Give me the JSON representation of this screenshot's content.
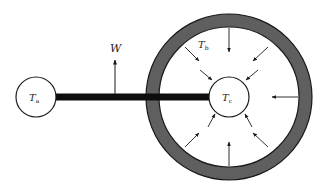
{
  "diagram": {
    "type": "heat-transfer-schematic",
    "colors": {
      "background": "#ffffff",
      "stroke": "#1a1a1a",
      "ring_fill": "#5f5f5f",
      "rod": "#0d0d0d"
    },
    "left_node": {
      "label_main": "T",
      "label_sub": "a",
      "cx": 36,
      "cy": 97,
      "r": 20
    },
    "rod": {
      "x1": 56,
      "x2": 209,
      "y": 97,
      "thickness": 7
    },
    "load": {
      "label": "W",
      "x": 115,
      "y_base": 94,
      "y_tip": 60,
      "label_x": 110,
      "label_y": 52
    },
    "enclosure": {
      "cx": 229,
      "cy": 97,
      "outer_r": 83,
      "inner_r": 70,
      "label_main": "T",
      "label_sub": "b",
      "label_x": 198,
      "label_y": 48
    },
    "center_node": {
      "label_main": "T",
      "label_sub": "c",
      "cx": 229,
      "cy": 97,
      "r": 20
    },
    "radiation_arrows": {
      "count": 8,
      "direction": "inward",
      "angles_deg": [
        90,
        45,
        0,
        -45,
        -90,
        -135,
        180,
        135
      ]
    }
  }
}
